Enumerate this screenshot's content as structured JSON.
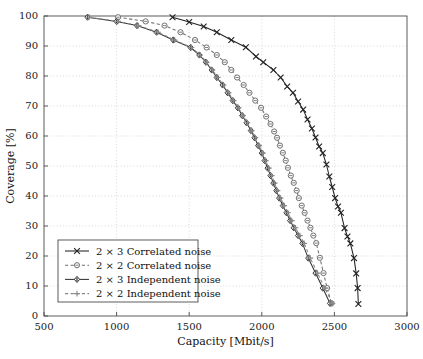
{
  "chart_data": {
    "type": "line",
    "title": "",
    "xlabel": "Capacity [Mbit/s]",
    "ylabel": "Coverage [%]",
    "xlim": [
      500,
      3000
    ],
    "ylim": [
      0,
      100
    ],
    "xticks": [
      500,
      1000,
      1500,
      2000,
      2500,
      3000
    ],
    "yticks": [
      0,
      10,
      20,
      30,
      40,
      50,
      60,
      70,
      80,
      90,
      100
    ],
    "grid": true,
    "grid_style": "dotted",
    "legend_position": "lower-left",
    "series": [
      {
        "name": "2 × 3 Correlated noise",
        "marker": "x",
        "line": "solid",
        "color": "#222222",
        "points": [
          [
            1385,
            99.6
          ],
          [
            1500,
            98.0
          ],
          [
            1600,
            96.5
          ],
          [
            1690,
            94.6
          ],
          [
            1790,
            92.0
          ],
          [
            1890,
            89.6
          ],
          [
            1960,
            86.5
          ],
          [
            2010,
            84.6
          ],
          [
            2080,
            82.0
          ],
          [
            2130,
            79.5
          ],
          [
            2175,
            76.5
          ],
          [
            2215,
            74.4
          ],
          [
            2250,
            71.5
          ],
          [
            2285,
            68.8
          ],
          [
            2315,
            65.5
          ],
          [
            2345,
            62.5
          ],
          [
            2370,
            59.5
          ],
          [
            2395,
            56.5
          ],
          [
            2420,
            54.3
          ],
          [
            2445,
            50.5
          ],
          [
            2465,
            46.5
          ],
          [
            2485,
            43.0
          ],
          [
            2505,
            39.3
          ],
          [
            2525,
            36.5
          ],
          [
            2545,
            34.4
          ],
          [
            2570,
            29.3
          ],
          [
            2590,
            26.5
          ],
          [
            2610,
            24.2
          ],
          [
            2635,
            19.3
          ],
          [
            2650,
            14.2
          ],
          [
            2660,
            9.3
          ],
          [
            2665,
            4.0
          ]
        ]
      },
      {
        "name": "2 × 2 Correlated noise",
        "marker": "circle",
        "line": "dashed",
        "color": "#707070",
        "points": [
          [
            1010,
            99.6
          ],
          [
            1200,
            98.2
          ],
          [
            1330,
            96.8
          ],
          [
            1440,
            94.6
          ],
          [
            1540,
            92.0
          ],
          [
            1620,
            89.5
          ],
          [
            1690,
            87.0
          ],
          [
            1745,
            84.6
          ],
          [
            1790,
            82.0
          ],
          [
            1830,
            79.5
          ],
          [
            1875,
            77.0
          ],
          [
            1915,
            74.4
          ],
          [
            1955,
            71.8
          ],
          [
            1995,
            69.4
          ],
          [
            2030,
            66.5
          ],
          [
            2060,
            64.0
          ],
          [
            2085,
            61.5
          ],
          [
            2105,
            59.4
          ],
          [
            2125,
            56.8
          ],
          [
            2145,
            54.4
          ],
          [
            2165,
            51.8
          ],
          [
            2180,
            49.4
          ],
          [
            2200,
            46.8
          ],
          [
            2220,
            44.4
          ],
          [
            2240,
            41.8
          ],
          [
            2255,
            39.3
          ],
          [
            2275,
            36.8
          ],
          [
            2295,
            34.4
          ],
          [
            2315,
            31.8
          ],
          [
            2335,
            29.4
          ],
          [
            2355,
            26.8
          ],
          [
            2375,
            24.3
          ],
          [
            2400,
            19.4
          ],
          [
            2425,
            14.3
          ],
          [
            2450,
            9.3
          ],
          [
            2480,
            4.2
          ]
        ]
      },
      {
        "name": "2 × 3 Independent noise",
        "marker": "diamond",
        "line": "solid",
        "color": "#333333",
        "points": [
          [
            800,
            99.6
          ],
          [
            1000,
            98.2
          ],
          [
            1140,
            96.8
          ],
          [
            1275,
            94.6
          ],
          [
            1390,
            92.0
          ],
          [
            1510,
            89.5
          ],
          [
            1570,
            87.0
          ],
          [
            1615,
            84.6
          ],
          [
            1655,
            82.0
          ],
          [
            1690,
            79.5
          ],
          [
            1730,
            77.0
          ],
          [
            1765,
            74.4
          ],
          [
            1800,
            71.8
          ],
          [
            1835,
            69.4
          ],
          [
            1865,
            66.8
          ],
          [
            1895,
            64.4
          ],
          [
            1925,
            61.8
          ],
          [
            1950,
            59.4
          ],
          [
            1975,
            56.8
          ],
          [
            2000,
            54.3
          ],
          [
            2020,
            51.8
          ],
          [
            2040,
            49.3
          ],
          [
            2060,
            46.8
          ],
          [
            2080,
            44.3
          ],
          [
            2100,
            41.8
          ],
          [
            2120,
            39.3
          ],
          [
            2145,
            36.8
          ],
          [
            2170,
            34.4
          ],
          [
            2195,
            31.8
          ],
          [
            2220,
            29.4
          ],
          [
            2250,
            26.8
          ],
          [
            2280,
            24.2
          ],
          [
            2320,
            19.3
          ],
          [
            2370,
            14.3
          ],
          [
            2420,
            9.3
          ],
          [
            2470,
            4.2
          ]
        ]
      },
      {
        "name": "2 × 2 Independent noise",
        "marker": "plus",
        "line": "dashed",
        "color": "#888888",
        "points": [
          [
            810,
            99.6
          ],
          [
            1010,
            98.2
          ],
          [
            1150,
            96.8
          ],
          [
            1285,
            94.6
          ],
          [
            1400,
            92.0
          ],
          [
            1515,
            89.5
          ],
          [
            1575,
            87.0
          ],
          [
            1620,
            84.6
          ],
          [
            1660,
            82.0
          ],
          [
            1697,
            79.5
          ],
          [
            1736,
            77.0
          ],
          [
            1772,
            74.4
          ],
          [
            1806,
            71.8
          ],
          [
            1840,
            69.4
          ],
          [
            1870,
            66.8
          ],
          [
            1900,
            64.4
          ],
          [
            1930,
            61.8
          ],
          [
            1956,
            59.4
          ],
          [
            1982,
            56.8
          ],
          [
            2007,
            54.3
          ],
          [
            2027,
            51.8
          ],
          [
            2048,
            49.3
          ],
          [
            2068,
            46.8
          ],
          [
            2088,
            44.3
          ],
          [
            2108,
            41.8
          ],
          [
            2129,
            39.3
          ],
          [
            2154,
            36.8
          ],
          [
            2180,
            34.4
          ],
          [
            2206,
            31.8
          ],
          [
            2232,
            29.4
          ],
          [
            2262,
            26.8
          ],
          [
            2292,
            24.2
          ],
          [
            2334,
            19.3
          ],
          [
            2384,
            14.3
          ],
          [
            2434,
            9.3
          ],
          [
            2486,
            4.2
          ]
        ]
      }
    ]
  }
}
